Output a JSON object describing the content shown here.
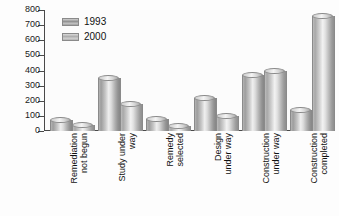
{
  "chart_data": {
    "type": "bar",
    "title": "",
    "xlabel": "",
    "ylabel": "",
    "ylim": [
      0,
      800
    ],
    "yticks": [
      0,
      100,
      200,
      300,
      400,
      500,
      600,
      700,
      800
    ],
    "ytick_labels": [
      "0",
      "100",
      "200",
      "300",
      "400",
      "500",
      "600",
      "700",
      "800"
    ],
    "grid": false,
    "legend_position": "top-left",
    "categories": [
      "Remediation\nnot begun",
      "Study under\nway",
      "Remedy\nselected",
      "Design\nunder way",
      "Construction\nunder way",
      "Construction\ncompleted"
    ],
    "series": [
      {
        "name": "1993",
        "values": [
          70,
          350,
          80,
          215,
          370,
          140
        ]
      },
      {
        "name": "2000",
        "values": [
          40,
          180,
          30,
          100,
          395,
          760
        ]
      }
    ]
  },
  "legend": {
    "items": [
      {
        "label": "1993",
        "swatch": "cylinder-swatch-1993"
      },
      {
        "label": "2000",
        "swatch": "cylinder-swatch-2000"
      }
    ]
  }
}
